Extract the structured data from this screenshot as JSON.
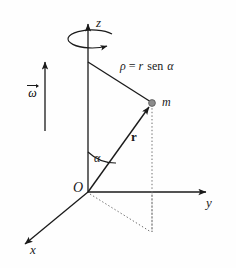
{
  "figure": {
    "background_color": "#fefefe",
    "line_color": "#1a1a1a",
    "point_fill_color": "#8c8c8c",
    "dotted_color": "#6e6e6e"
  },
  "axes": {
    "z": {
      "label": "z"
    },
    "y": {
      "label": "y"
    },
    "x": {
      "label": "x"
    }
  },
  "origin": {
    "label": "O"
  },
  "point_mass": {
    "label": "m"
  },
  "vectors": {
    "r": {
      "label": "r"
    },
    "omega": {
      "glyph": "ω"
    }
  },
  "angle": {
    "label": "α"
  },
  "rho": {
    "symbol": "ρ",
    "equals": "=",
    "radius": "r",
    "function": "sen",
    "argument": "α",
    "full": "ρ = r sen α"
  }
}
